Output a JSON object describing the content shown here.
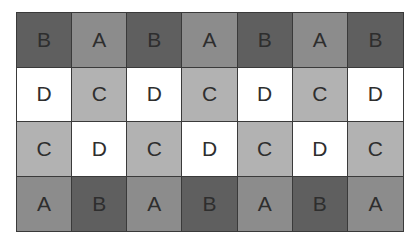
{
  "colors": {
    "A": "#8c8c8c",
    "B": "#5f5f5f",
    "C": "#b2b2b2",
    "D": "#ffffff"
  },
  "rows": [
    [
      "B",
      "A",
      "B",
      "A",
      "B",
      "A",
      "B"
    ],
    [
      "D",
      "C",
      "D",
      "C",
      "D",
      "C",
      "D"
    ],
    [
      "C",
      "D",
      "C",
      "D",
      "C",
      "D",
      "C"
    ],
    [
      "A",
      "B",
      "A",
      "B",
      "A",
      "B",
      "A"
    ]
  ]
}
